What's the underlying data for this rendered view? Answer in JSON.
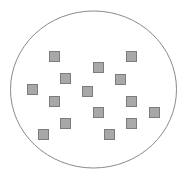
{
  "diagram": {
    "type": "set-of-squares-in-ellipse",
    "background": "#ffffff",
    "ellipse": {
      "cx": 93.5,
      "cy": 89.5,
      "rx": 83,
      "ry": 78.5,
      "stroke": "#8a8a8a",
      "stroke_width": 1
    },
    "square_size": 11,
    "square_fill": "#a8a8a8",
    "square_stroke": "#7c7c7c",
    "square_count": 15,
    "squares": [
      {
        "x": 49,
        "y": 51
      },
      {
        "x": 126,
        "y": 51
      },
      {
        "x": 93,
        "y": 62
      },
      {
        "x": 60,
        "y": 73
      },
      {
        "x": 115,
        "y": 74
      },
      {
        "x": 27,
        "y": 84
      },
      {
        "x": 82,
        "y": 86
      },
      {
        "x": 49,
        "y": 96
      },
      {
        "x": 126,
        "y": 96
      },
      {
        "x": 93,
        "y": 107
      },
      {
        "x": 149,
        "y": 107
      },
      {
        "x": 60,
        "y": 118
      },
      {
        "x": 126,
        "y": 118
      },
      {
        "x": 38,
        "y": 129
      },
      {
        "x": 104,
        "y": 129
      }
    ]
  }
}
